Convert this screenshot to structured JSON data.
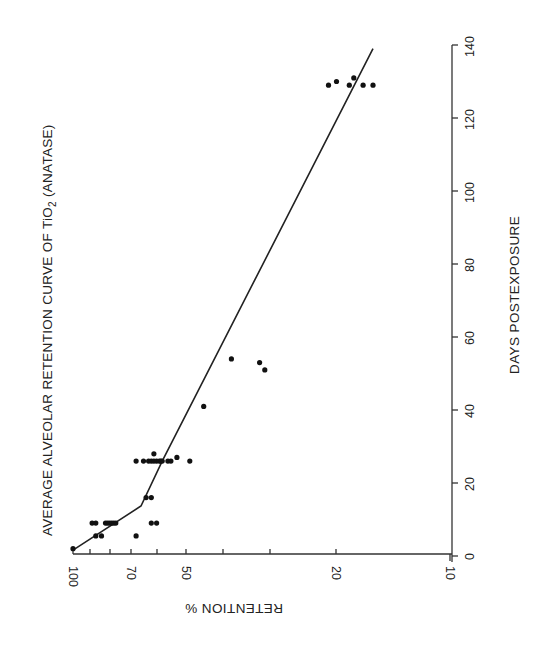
{
  "chart_data": {
    "type": "scatter",
    "title_parts": {
      "before": "AVERAGE ALVEOLAR RETENTION CURVE OF TiO",
      "subscript": "2",
      "after": " (ANATASE)"
    },
    "orientation": "rotated 90deg counter-clockwise (page printed sideways)",
    "xlabel": "DAYS POSTEXPOSURE",
    "ylabel": "RETENTION %",
    "x_axis": {
      "scale": "linear",
      "range": [
        0,
        140
      ],
      "ticks": [
        0,
        20,
        40,
        60,
        80,
        100,
        120,
        140
      ],
      "tick_labels": [
        "0",
        "20",
        "40",
        "60",
        "80",
        "100",
        "120",
        "140"
      ]
    },
    "y_axis": {
      "scale": "log",
      "range": [
        10,
        100
      ],
      "ticks": [
        100,
        90,
        80,
        70,
        60,
        50,
        40,
        30,
        20,
        10
      ],
      "tick_labels": [
        "100",
        "",
        "",
        "70",
        "",
        "50",
        "",
        "",
        "20",
        "10"
      ]
    },
    "grid": false,
    "legend": null,
    "series": [
      {
        "name": "Observed retention",
        "type": "scatter",
        "points": [
          {
            "day": 2,
            "retention": 100
          },
          {
            "day": 5.5,
            "retention": 87
          },
          {
            "day": 5.5,
            "retention": 84
          },
          {
            "day": 5.5,
            "retention": 68
          },
          {
            "day": 9,
            "retention": 89
          },
          {
            "day": 9,
            "retention": 87
          },
          {
            "day": 9,
            "retention": 82
          },
          {
            "day": 9,
            "retention": 81
          },
          {
            "day": 9,
            "retention": 80
          },
          {
            "day": 9,
            "retention": 79
          },
          {
            "day": 9,
            "retention": 78
          },
          {
            "day": 9,
            "retention": 77
          },
          {
            "day": 9,
            "retention": 62
          },
          {
            "day": 9,
            "retention": 60
          },
          {
            "day": 16,
            "retention": 64
          },
          {
            "day": 16,
            "retention": 62
          },
          {
            "day": 26,
            "retention": 68
          },
          {
            "day": 26,
            "retention": 65
          },
          {
            "day": 26,
            "retention": 63
          },
          {
            "day": 26,
            "retention": 62
          },
          {
            "day": 26,
            "retention": 61
          },
          {
            "day": 26,
            "retention": 60
          },
          {
            "day": 26,
            "retention": 59
          },
          {
            "day": 26,
            "retention": 58.5
          },
          {
            "day": 26,
            "retention": 58
          },
          {
            "day": 26,
            "retention": 56
          },
          {
            "day": 26,
            "retention": 55
          },
          {
            "day": 26,
            "retention": 49
          },
          {
            "day": 28,
            "retention": 61
          },
          {
            "day": 27,
            "retention": 53
          },
          {
            "day": 41,
            "retention": 45
          },
          {
            "day": 54,
            "retention": 38
          },
          {
            "day": 53,
            "retention": 32
          },
          {
            "day": 51,
            "retention": 31
          },
          {
            "day": 129,
            "retention": 21
          },
          {
            "day": 130,
            "retention": 20
          },
          {
            "day": 129,
            "retention": 18.5
          },
          {
            "day": 131,
            "retention": 18
          },
          {
            "day": 129,
            "retention": 17
          },
          {
            "day": 129,
            "retention": 16
          }
        ]
      },
      {
        "name": "Average retention curve",
        "type": "line",
        "points": [
          {
            "day": 1.6,
            "retention": 100
          },
          {
            "day": 13.7,
            "retention": 66
          },
          {
            "day": 26,
            "retention": 58
          },
          {
            "day": 139,
            "retention": 16
          }
        ]
      }
    ]
  },
  "labels": {
    "title_before": "AVERAGE ALVEOLAR RETENTION CURVE OF TiO",
    "title_sub": "2",
    "title_after": " (ANATASE)",
    "x_axis_label": "DAYS POSTEXPOSURE",
    "y_axis_label": "RETENTION %",
    "day_ticks": [
      "0",
      "20",
      "40",
      "60",
      "80",
      "100",
      "120",
      "140"
    ],
    "retention_ticks": {
      "t100": "100",
      "t70": "70",
      "t50": "50",
      "t20": "20",
      "t10": "10"
    }
  }
}
